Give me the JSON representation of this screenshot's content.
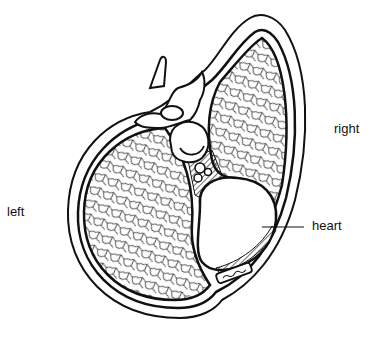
{
  "diagram": {
    "labels": {
      "left": "left",
      "right": "right",
      "heart": "heart"
    },
    "colors": {
      "ink": "#111111",
      "background": "#ffffff"
    }
  }
}
